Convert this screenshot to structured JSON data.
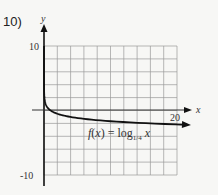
{
  "problem": {
    "number": "10)"
  },
  "chart_data": {
    "type": "line",
    "title": "",
    "function_label": "f(x) = log_{1/4} x",
    "function_label_parts": {
      "lhs": "f(x) = log",
      "base": "1/4",
      "var": "x"
    },
    "xlabel": "x",
    "ylabel": "y",
    "xlim": [
      0,
      20
    ],
    "ylim": [
      -10,
      10
    ],
    "x_ticks_labeled": [
      "20"
    ],
    "y_ticks_labeled": [
      "10",
      "-10"
    ],
    "grid": true,
    "grid_step": 2,
    "series": [
      {
        "name": "f(x) = log_{1/4} x",
        "x": [
          0.02,
          0.05,
          0.1,
          0.25,
          0.5,
          1,
          2,
          4,
          8,
          12,
          16,
          20,
          21.5
        ],
        "y": [
          2.82,
          2.16,
          1.66,
          1.0,
          0.5,
          0,
          -0.5,
          -1.0,
          -1.5,
          -1.79,
          -2.0,
          -2.16,
          -2.21
        ]
      }
    ],
    "arrows": {
      "x_axis": "right",
      "y_axis": "up",
      "curve_end": "right"
    }
  },
  "colors": {
    "grid": "#9a9a9a",
    "axis": "#111111",
    "curve": "#111111",
    "background": "#f7f7f5"
  }
}
